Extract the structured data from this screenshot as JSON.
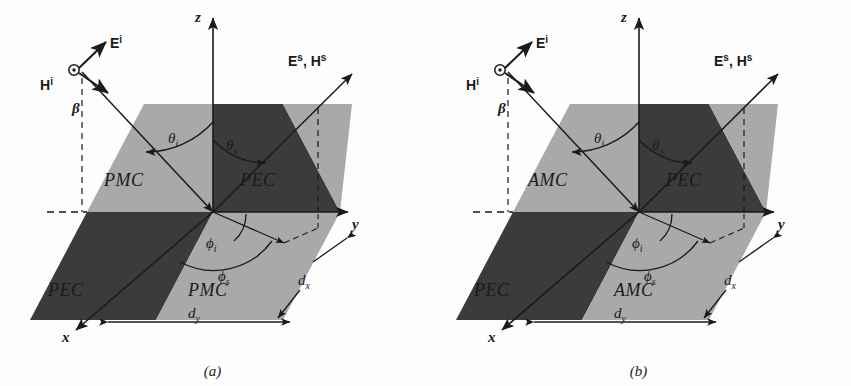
{
  "figure": {
    "type": "scientific-diagram",
    "panels": [
      {
        "id": "a",
        "caption": "(a)",
        "quadrants": [
          {
            "position": "upper-left",
            "label": "PMC",
            "shade": "light"
          },
          {
            "position": "upper-right",
            "label": "PEC",
            "shade": "dark"
          },
          {
            "position": "lower-left",
            "label": "PEC",
            "shade": "dark"
          },
          {
            "position": "lower-right",
            "label": "PMC",
            "shade": "light"
          }
        ],
        "axes": [
          {
            "name": "z-axis",
            "label": "z"
          },
          {
            "name": "y-axis",
            "label": "y"
          },
          {
            "name": "x-axis",
            "label": "x"
          }
        ],
        "vectors": [
          {
            "name": "incident-electric-field",
            "label": "E",
            "superscript": "i"
          },
          {
            "name": "incident-magnetic-field",
            "label": "H",
            "superscript": "i"
          },
          {
            "name": "incident-propagation",
            "label": "β"
          },
          {
            "name": "scattered-fields",
            "label": "Eˢ, Hˢ"
          }
        ],
        "angles": [
          {
            "name": "incident-polar-angle",
            "symbol": "θ",
            "subscript": "i"
          },
          {
            "name": "scattered-polar-angle",
            "symbol": "θ",
            "subscript": "s"
          },
          {
            "name": "incident-azimuth-angle",
            "symbol": "ϕ",
            "subscript": "i"
          },
          {
            "name": "scattered-azimuth-angle",
            "symbol": "ϕ",
            "subscript": "s"
          }
        ],
        "dimensions": [
          {
            "name": "cell-width-x",
            "symbol": "d",
            "subscript": "x"
          },
          {
            "name": "cell-width-y",
            "symbol": "d",
            "subscript": "y"
          }
        ]
      },
      {
        "id": "b",
        "caption": "(b)",
        "quadrants": [
          {
            "position": "upper-left",
            "label": "AMC",
            "shade": "light"
          },
          {
            "position": "upper-right",
            "label": "PEC",
            "shade": "dark"
          },
          {
            "position": "lower-left",
            "label": "PEC",
            "shade": "dark"
          },
          {
            "position": "lower-right",
            "label": "AMC",
            "shade": "light"
          }
        ],
        "axes": [
          {
            "name": "z-axis",
            "label": "z"
          },
          {
            "name": "y-axis",
            "label": "y"
          },
          {
            "name": "x-axis",
            "label": "x"
          }
        ],
        "vectors": [
          {
            "name": "incident-electric-field",
            "label": "E",
            "superscript": "i"
          },
          {
            "name": "incident-magnetic-field",
            "label": "H",
            "superscript": "i"
          },
          {
            "name": "incident-propagation",
            "label": "β"
          },
          {
            "name": "scattered-fields",
            "label": "Eˢ, Hˢ"
          }
        ],
        "angles": [
          {
            "name": "incident-polar-angle",
            "symbol": "θ",
            "subscript": "i"
          },
          {
            "name": "scattered-polar-angle",
            "symbol": "θ",
            "subscript": "s"
          },
          {
            "name": "incident-azimuth-angle",
            "symbol": "ϕ",
            "subscript": "i"
          },
          {
            "name": "scattered-azimuth-angle",
            "symbol": "ϕ",
            "subscript": "s"
          }
        ],
        "dimensions": [
          {
            "name": "cell-width-x",
            "symbol": "d",
            "subscript": "x"
          },
          {
            "name": "cell-width-y",
            "symbol": "d",
            "subscript": "y"
          }
        ]
      }
    ],
    "colors": {
      "light_patch": "#a9a9a9",
      "dark_patch": "#3b3b3b",
      "line": "#1a1a1a",
      "background": "#fdfdfd"
    },
    "symbols": {
      "E_sup": "i",
      "H_sup": "i",
      "scattered_E": "E",
      "scattered_H": "H",
      "scattered_sup": "s",
      "comma": ",",
      "theta": "θ",
      "phi": "ϕ",
      "beta": "β",
      "d": "d",
      "sub_i": "i",
      "sub_s": "s",
      "sub_x": "x",
      "sub_y": "y"
    }
  }
}
